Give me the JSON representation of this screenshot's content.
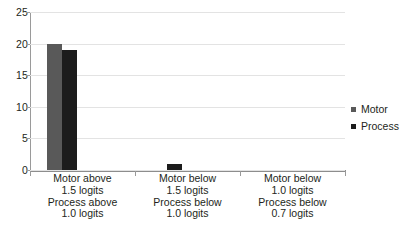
{
  "chart_data": {
    "type": "bar",
    "title": "",
    "xlabel": "",
    "ylabel": "",
    "ylim": [
      0,
      25
    ],
    "yticks": [
      0,
      5,
      10,
      15,
      20,
      25
    ],
    "grid": true,
    "legend_position": "right",
    "categories": [
      "Motor above 1.5 logits Process above 1.0 logits",
      "Motor below 1.5 logits Process below 1.0 logits",
      "Motor below 1.0 logits Process below 0.7 logits"
    ],
    "category_lines": [
      [
        "Motor above",
        "1.5 logits",
        "Process above",
        "1.0 logits"
      ],
      [
        "Motor below",
        "1.5 logits",
        "Process below",
        "1.0 logits"
      ],
      [
        "Motor below",
        "1.0 logits",
        "Process below",
        "0.7 logits"
      ]
    ],
    "series": [
      {
        "name": "Motor",
        "color": "#595959",
        "values": [
          20,
          0,
          0
        ]
      },
      {
        "name": "Process",
        "color": "#1c1c1c",
        "values": [
          19,
          1,
          0
        ]
      }
    ]
  },
  "axis": {
    "y_tick_labels": [
      "25",
      "20",
      "15",
      "10",
      "5",
      "0"
    ]
  },
  "legend": {
    "items": [
      {
        "label": "Motor",
        "color": "#595959"
      },
      {
        "label": "Process",
        "color": "#1c1c1c"
      }
    ]
  },
  "footer": {
    "artifact_text": ""
  }
}
